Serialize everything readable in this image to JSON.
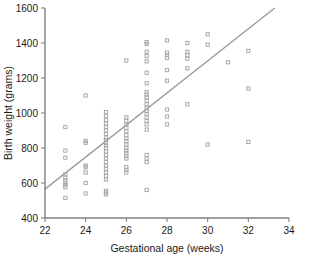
{
  "chart_data": {
    "type": "scatter",
    "title": "",
    "xlabel": "Gestational age (weeks)",
    "ylabel": "Birth weight (grams)",
    "xlim": [
      22,
      34
    ],
    "ylim": [
      400,
      1600
    ],
    "xticks": [
      22,
      24,
      26,
      28,
      30,
      32,
      34
    ],
    "xtick_labels": [
      "22",
      "24",
      "26",
      "28",
      "30",
      "32",
      "34"
    ],
    "yticks": [
      400,
      600,
      800,
      1000,
      1200,
      1400,
      1600
    ],
    "ytick_labels": [
      "400",
      "600",
      "800",
      "1000",
      "1200",
      "1400",
      "1600"
    ],
    "grid": false,
    "legend": null,
    "marker": "open-square",
    "marker_color": "#a9a9a9",
    "trend_line": {
      "label": "linear regression fit",
      "color": "#9a9a9a",
      "x_start": 22.0,
      "y_start": 565,
      "x_end": 33.3,
      "y_end": 1600
    },
    "points": [
      [
        23,
        920
      ],
      [
        23,
        785
      ],
      [
        23,
        745
      ],
      [
        23,
        650
      ],
      [
        23,
        630
      ],
      [
        23,
        615
      ],
      [
        23,
        600
      ],
      [
        23,
        588
      ],
      [
        23,
        575
      ],
      [
        23,
        515
      ],
      [
        24,
        1100
      ],
      [
        24,
        840
      ],
      [
        24,
        830
      ],
      [
        24,
        700
      ],
      [
        24,
        690
      ],
      [
        24,
        660
      ],
      [
        24,
        600
      ],
      [
        24,
        540
      ],
      [
        25,
        1005
      ],
      [
        25,
        985
      ],
      [
        25,
        960
      ],
      [
        25,
        940
      ],
      [
        25,
        920
      ],
      [
        25,
        900
      ],
      [
        25,
        880
      ],
      [
        25,
        860
      ],
      [
        25,
        845
      ],
      [
        25,
        830
      ],
      [
        25,
        815
      ],
      [
        25,
        800
      ],
      [
        25,
        780
      ],
      [
        25,
        760
      ],
      [
        25,
        740
      ],
      [
        25,
        720
      ],
      [
        25,
        700
      ],
      [
        25,
        680
      ],
      [
        25,
        660
      ],
      [
        25,
        640
      ],
      [
        25,
        620
      ],
      [
        25,
        555
      ],
      [
        25,
        545
      ],
      [
        25,
        535
      ],
      [
        26,
        1300
      ],
      [
        26,
        975
      ],
      [
        26,
        955
      ],
      [
        26,
        935
      ],
      [
        26,
        915
      ],
      [
        26,
        895
      ],
      [
        26,
        875
      ],
      [
        26,
        855
      ],
      [
        26,
        840
      ],
      [
        26,
        820
      ],
      [
        26,
        800
      ],
      [
        26,
        785
      ],
      [
        26,
        770
      ],
      [
        26,
        755
      ],
      [
        26,
        740
      ],
      [
        26,
        690
      ],
      [
        26,
        675
      ],
      [
        26,
        660
      ],
      [
        27,
        1405
      ],
      [
        27,
        1395
      ],
      [
        27,
        1350
      ],
      [
        27,
        1325
      ],
      [
        27,
        1295
      ],
      [
        27,
        1230
      ],
      [
        27,
        1170
      ],
      [
        27,
        1120
      ],
      [
        27,
        1105
      ],
      [
        27,
        1090
      ],
      [
        27,
        1070
      ],
      [
        27,
        1050
      ],
      [
        27,
        1030
      ],
      [
        27,
        1010
      ],
      [
        27,
        995
      ],
      [
        27,
        975
      ],
      [
        27,
        955
      ],
      [
        27,
        935
      ],
      [
        27,
        905
      ],
      [
        27,
        760
      ],
      [
        27,
        740
      ],
      [
        27,
        720
      ],
      [
        27,
        560
      ],
      [
        28,
        1415
      ],
      [
        28,
        1345
      ],
      [
        28,
        1330
      ],
      [
        28,
        1315
      ],
      [
        28,
        1245
      ],
      [
        28,
        1185
      ],
      [
        28,
        1020
      ],
      [
        28,
        980
      ],
      [
        28,
        935
      ],
      [
        29,
        1400
      ],
      [
        29,
        1350
      ],
      [
        29,
        1330
      ],
      [
        29,
        1310
      ],
      [
        29,
        1255
      ],
      [
        29,
        1050
      ],
      [
        30,
        1450
      ],
      [
        30,
        1390
      ],
      [
        30,
        820
      ],
      [
        31,
        1290
      ],
      [
        32,
        1355
      ],
      [
        32,
        1140
      ],
      [
        32,
        835
      ]
    ]
  }
}
